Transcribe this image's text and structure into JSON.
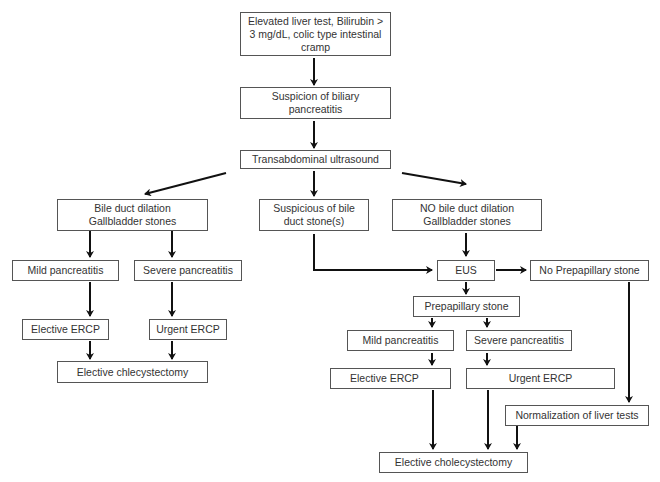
{
  "diagram": {
    "type": "flowchart",
    "nodes": {
      "start": "Elevated liver test, Bilirubin > 3 mg/dL, colic type intestinal cramp",
      "suspicion": "Suspicion of biliary pancreatitis",
      "ultrasound": "Transabdominal ultrasound",
      "dilation": "Bile duct dilation Gallbladder stones",
      "suspicious_stone": "Suspicious of bile duct stone(s)",
      "no_dilation": "NO bile duct dilation Gallbladder stones",
      "left_mild": "Mild pancreatitis",
      "left_severe": "Severe pancreatitis",
      "left_elective_ercp": "Elective ERCP",
      "left_urgent_ercp": "Urgent ERCP",
      "left_chole": "Elective chlecystectomy",
      "eus": "EUS",
      "no_prepapillary": "No Prepapillary stone",
      "prepapillary": "Prepapillary stone",
      "right_mild": "Mild pancreatitis",
      "right_severe": "Severe pancreatitis",
      "right_elective_ercp": "Elective ERCP",
      "right_urgent_ercp": "Urgent ERCP",
      "normalization": "Normalization of liver tests",
      "right_chole": "Elective cholecystectomy"
    },
    "lines": {
      "start": [
        "Elevated liver test, Bilirubin >",
        "3 mg/dL, colic type intestinal",
        "cramp"
      ],
      "suspicion": [
        "Suspicion of biliary",
        "pancreatitis"
      ],
      "dilation": [
        "Bile duct dilation",
        "Gallbladder stones"
      ],
      "suspicious_stone": [
        "Suspicious of bile",
        "duct stone(s)"
      ],
      "no_dilation": [
        "NO bile duct dilation",
        "Gallbladder stones"
      ]
    },
    "edges": [
      [
        "start",
        "suspicion"
      ],
      [
        "suspicion",
        "ultrasound"
      ],
      [
        "ultrasound",
        "dilation"
      ],
      [
        "ultrasound",
        "suspicious_stone"
      ],
      [
        "ultrasound",
        "no_dilation"
      ],
      [
        "dilation",
        "left_mild"
      ],
      [
        "dilation",
        "left_severe"
      ],
      [
        "left_mild",
        "left_elective_ercp"
      ],
      [
        "left_severe",
        "left_urgent_ercp"
      ],
      [
        "left_elective_ercp",
        "left_chole"
      ],
      [
        "left_urgent_ercp",
        "left_chole"
      ],
      [
        "suspicious_stone",
        "eus"
      ],
      [
        "no_dilation",
        "eus"
      ],
      [
        "eus",
        "no_prepapillary"
      ],
      [
        "eus",
        "prepapillary"
      ],
      [
        "prepapillary",
        "right_mild"
      ],
      [
        "prepapillary",
        "right_severe"
      ],
      [
        "right_mild",
        "right_elective_ercp"
      ],
      [
        "right_severe",
        "right_urgent_ercp"
      ],
      [
        "no_prepapillary",
        "normalization"
      ],
      [
        "right_elective_ercp",
        "right_chole"
      ],
      [
        "right_urgent_ercp",
        "right_chole"
      ],
      [
        "normalization",
        "right_chole"
      ]
    ],
    "colors": {
      "border": "#555555",
      "arrow": "#111111",
      "text": "#333333"
    }
  }
}
